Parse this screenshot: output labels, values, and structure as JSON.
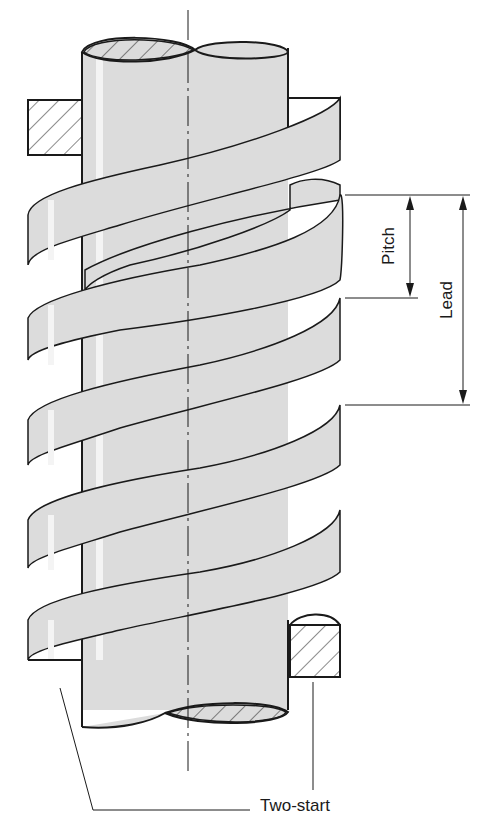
{
  "diagram": {
    "colors": {
      "fill": "#dcdcdc",
      "stroke": "#1a1a1a",
      "background": "#ffffff",
      "highlight": "#f4f4f4"
    },
    "labels": {
      "pitch": "Pitch",
      "lead": "Lead",
      "two_start": "Two-start"
    },
    "dimensions": [
      {
        "name": "pitch",
        "from_y": 195,
        "to_y": 298,
        "x": 410
      },
      {
        "name": "lead",
        "from_y": 195,
        "to_y": 405,
        "x": 463
      }
    ],
    "thread_crests_y": [
      195,
      298,
      405,
      510
    ]
  }
}
